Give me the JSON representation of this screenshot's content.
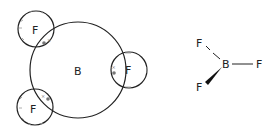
{
  "diagram": {
    "dot_cross": {
      "central_atom": {
        "label": "B",
        "cx": 78,
        "cy": 70,
        "r": 48
      },
      "outer_atoms": [
        {
          "label": "F",
          "cx": 36,
          "cy": 29,
          "r": 18,
          "bond_mark": "dot-cross"
        },
        {
          "label": "F",
          "cx": 129,
          "cy": 70,
          "r": 18,
          "bond_mark": "dot-cross"
        },
        {
          "label": "F",
          "cx": 35,
          "cy": 107,
          "r": 18,
          "bond_mark": "dot-cross"
        }
      ],
      "electron_style": {
        "dot": "•",
        "cross": "×",
        "color": "#777777"
      }
    },
    "structural_formula": {
      "central_atom": {
        "label": "B"
      },
      "atoms": [
        {
          "label": "F",
          "position": "upper-left",
          "bond": "dashed-plain"
        },
        {
          "label": "F",
          "position": "right",
          "bond": "single"
        },
        {
          "label": "F",
          "position": "lower-left",
          "bond": "wedge"
        }
      ]
    },
    "colors": {
      "line": "#222222",
      "text": "#222222",
      "electrons": "#777777"
    }
  }
}
